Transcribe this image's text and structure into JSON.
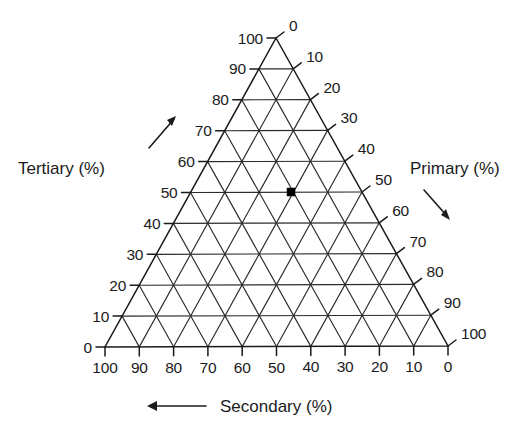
{
  "figure": {
    "type": "ternary-diagram",
    "background_color": "#ffffff",
    "line_color": "#2b2b2b",
    "text_color": "#1b1b1b"
  },
  "axes": {
    "left": {
      "title": "Tertiary (%)",
      "title_x": 18,
      "title_y": 168,
      "arrow_name": "tertiary-arrow",
      "arrow_direction": "up-right",
      "tick_labels": [
        "0",
        "10",
        "20",
        "30",
        "40",
        "50",
        "60",
        "70",
        "80",
        "90",
        "100"
      ]
    },
    "right": {
      "title": "Primary (%)",
      "title_x": 410,
      "title_y": 168,
      "arrow_name": "primary-arrow",
      "arrow_direction": "down-right",
      "tick_labels": [
        "0",
        "10",
        "20",
        "30",
        "40",
        "50",
        "60",
        "70",
        "80",
        "90",
        "100"
      ]
    },
    "bottom": {
      "title": "Secondary (%)",
      "title_x": 222,
      "title_y": 412,
      "arrow_name": "secondary-arrow",
      "arrow_direction": "left",
      "tick_labels": [
        "100",
        "90",
        "80",
        "70",
        "60",
        "50",
        "40",
        "30",
        "20",
        "10",
        "0"
      ]
    }
  },
  "chart_data": {
    "type": "scatter",
    "chart_subtype": "ternary",
    "title": "",
    "xlabel": "Secondary (%)",
    "ylabel": "Tertiary (%)",
    "zlabel": "Primary (%)",
    "axis_names": [
      "Primary (%)",
      "Secondary (%)",
      "Tertiary (%)"
    ],
    "axis_ranges": {
      "primary": [
        0,
        100
      ],
      "secondary": [
        0,
        100
      ],
      "tertiary": [
        0,
        100
      ]
    },
    "tick_interval": 10,
    "grid": true,
    "legend": false,
    "axis_directions": {
      "primary": "decreasing down-right along right edge",
      "secondary": "decreasing left-to-right along bottom edge",
      "tertiary": "increasing up-right along left edge"
    },
    "tick_labels": {
      "primary_right_edge_top_to_bottom": [
        0,
        10,
        20,
        30,
        40,
        50,
        60,
        70,
        80,
        90,
        100
      ],
      "secondary_bottom_edge_left_to_right": [
        100,
        90,
        80,
        70,
        60,
        50,
        40,
        30,
        20,
        10,
        0
      ],
      "tertiary_left_edge_bottom_to_top": [
        0,
        10,
        20,
        30,
        40,
        50,
        60,
        70,
        80,
        90,
        100
      ]
    },
    "points": [
      {
        "label": "",
        "primary": 50,
        "secondary": 0,
        "tertiary": 50,
        "marker": "filled-square",
        "color": "#000000"
      }
    ],
    "annotations": [
      {
        "text": "Tertiary (%)",
        "position": "left"
      },
      {
        "text": "Primary (%)",
        "position": "right"
      },
      {
        "text": "Secondary (%)",
        "position": "bottom"
      }
    ]
  },
  "geometry": {
    "apex": {
      "x": 276,
      "y": 38
    },
    "bottom_left": {
      "x": 105,
      "y": 347
    },
    "bottom_right": {
      "x": 448,
      "y": 346
    },
    "divisions": 10,
    "marker": {
      "x": 291,
      "y": 192
    }
  }
}
